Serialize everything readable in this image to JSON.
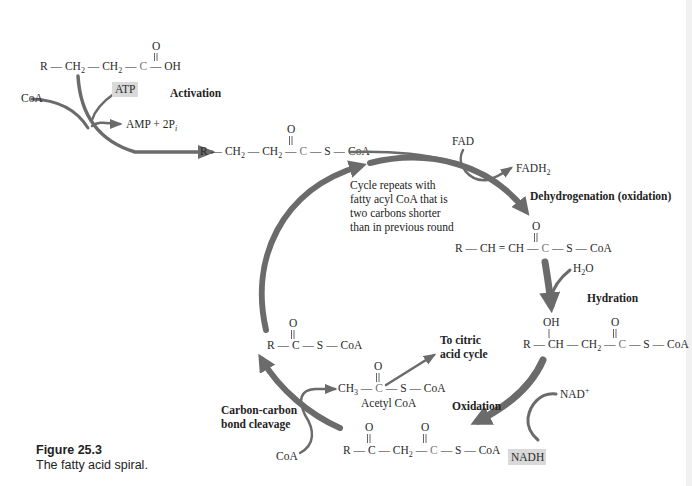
{
  "figure": {
    "number": "Figure 25.3",
    "caption": "The fatty acid spiral."
  },
  "colors": {
    "arrow": "#6b6b6b",
    "highlight_box": "#d9d9d9",
    "text": "#222222"
  },
  "molecules": {
    "fatty_acid": {
      "parts": [
        "R",
        "CH",
        "2",
        "CH",
        "2",
        "C",
        "OH"
      ],
      "carbonyl_O": "O"
    },
    "fatty_acyl_coa": {
      "parts": [
        "R",
        "CH",
        "2",
        "CH",
        "2",
        "C",
        "S",
        "CoA"
      ],
      "carbonyl_O": "O"
    },
    "enoyl_coa": {
      "parts": [
        "R",
        "CH",
        "CH",
        "C",
        "S",
        "CoA"
      ],
      "carbonyl_O": "O"
    },
    "hydroxyacyl_coa": {
      "parts": [
        "R",
        "CH",
        "CH",
        "2",
        "C",
        "S",
        "CoA"
      ],
      "hydroxyl": "OH",
      "carbonyl_O": "O"
    },
    "ketoacyl_coa": {
      "parts": [
        "R",
        "C",
        "CH",
        "2",
        "C",
        "S",
        "CoA"
      ],
      "carbonyl_O1": "O",
      "carbonyl_O2": "O"
    },
    "shortened_acyl_coa": {
      "parts": [
        "R",
        "C",
        "S",
        "CoA"
      ],
      "carbonyl_O": "O"
    },
    "acetyl_coa": {
      "parts": [
        "CH",
        "3",
        "C",
        "S",
        "CoA"
      ],
      "carbonyl_O": "O",
      "name": "Acetyl CoA"
    }
  },
  "reagents": {
    "coa_in": "CoA",
    "atp": "ATP",
    "amp_2pi": "AMP + 2P",
    "amp_sub": "i",
    "fad": "FAD",
    "fadh2": "FADH",
    "fadh2_sub": "2",
    "h2o_H": "H",
    "h2o_sub": "2",
    "h2o_O": "O",
    "nad": "NAD",
    "nad_sup": "+",
    "nadh": "NADH",
    "coa_cleave": "CoA"
  },
  "steps": {
    "activation": "Activation",
    "dehydrogenation": "Dehydrogenation (oxidation)",
    "hydration": "Hydration",
    "oxidation": "Oxidation",
    "cleavage_line1": "Carbon-carbon",
    "cleavage_line2": "bond cleavage",
    "to_citric_line1": "To citric",
    "to_citric_line2": "acid cycle"
  },
  "cycle_note": [
    "Cycle repeats with",
    "fatty acyl CoA that is",
    "two carbons shorter",
    "than in previous round"
  ]
}
